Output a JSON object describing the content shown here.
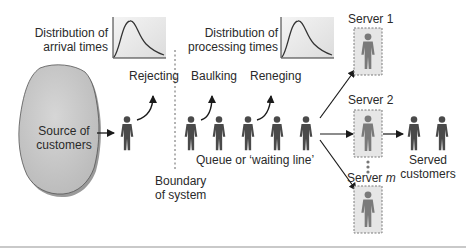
{
  "diagram": {
    "source": {
      "label_line1": "Source of",
      "label_line2": "customers"
    },
    "arrival_dist": {
      "label_line1": "Distribution of",
      "label_line2": "arrival times"
    },
    "processing_dist": {
      "label_line1": "Distribution of",
      "label_line2": "processing times"
    },
    "rejecting": "Rejecting",
    "baulking": "Baulking",
    "reneging": "Reneging",
    "queue_label": "Queue or ‘waiting line’",
    "boundary": {
      "line1": "Boundary",
      "line2": "of system"
    },
    "servers": [
      {
        "label": "Server 1"
      },
      {
        "label": "Server 2"
      },
      {
        "label_prefix": "Server ",
        "label_var": "m"
      }
    ],
    "served": {
      "line1": "Served",
      "line2": "customers"
    },
    "colors": {
      "figure": "#4a4a4a",
      "cloud_fill": "#c8c8c8",
      "server_box": "#e6e6e6",
      "server_border": "#7a7a7a",
      "arrow": "#1a1a1a",
      "rule": "#c9c9c9"
    }
  }
}
